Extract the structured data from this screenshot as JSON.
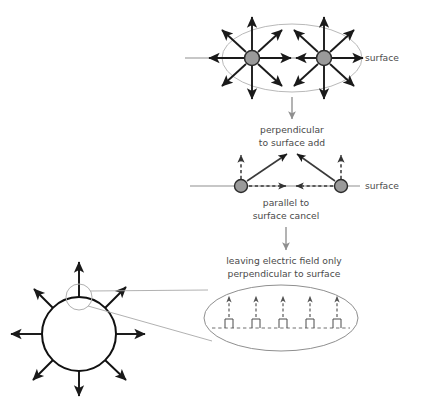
{
  "figure": {
    "background_color": "#ffffff"
  },
  "colors": {
    "arrow_dark": "#1a1a1a",
    "charge_fill": "#9a9a9a",
    "charge_stroke": "#2b2b2b",
    "surface_line": "#8c8c8c",
    "ellipse_stroke": "#b5b5b5",
    "connector_gray": "#9a9a9a",
    "text": "#4a4a4a",
    "sphere_stroke": "#111111",
    "dashed": "#6b6b6b"
  },
  "panels": {
    "top": {
      "name": "two-charges-full-field",
      "surface_label": "surface",
      "charge_count": 2,
      "arrows_per_charge": 8,
      "arrow_style": "solid",
      "enclosure": "ellipse"
    },
    "middle": {
      "name": "component-decomposition",
      "surface_label": "surface",
      "caption_above_line1": "perpendicular",
      "caption_above_line2": "to surface add",
      "caption_below_line1": "parallel to",
      "caption_below_line2": "surface cancel",
      "charge_count": 2,
      "perpendicular_arrow_style": "dashed",
      "parallel_arrow_style": "dashed",
      "resultant_arrow_style": "solid"
    },
    "bottom": {
      "name": "sphere-with-magnified-surface",
      "caption_line1": "leaving electric field only",
      "caption_line2": "perpendicular to surface",
      "sphere_arrows": 8,
      "magnified_field_arrows": 5,
      "magnified_charge_bumps": 5,
      "surface_line_style": "dashed"
    }
  }
}
